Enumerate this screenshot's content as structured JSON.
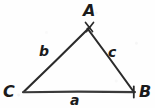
{
  "figure": {
    "kind": "geometry-diagram",
    "background_color": "#fefefe",
    "stroke_color": "#2b2b2b",
    "label_color": "#1b1b1b"
  },
  "vertices": [
    {
      "id": "A",
      "label": "A",
      "x": 89,
      "y": 27,
      "name": "vertex-a-apex"
    },
    {
      "id": "B",
      "label": "B",
      "x": 134,
      "y": 92,
      "name": "vertex-b-bottom-right"
    },
    {
      "id": "C",
      "label": "C",
      "x": 23,
      "y": 92,
      "name": "vertex-c-bottom-left"
    }
  ],
  "sides": [
    {
      "id": "a",
      "label": "a",
      "from": "C",
      "to": "B",
      "name": "side-a-bottom"
    },
    {
      "id": "b",
      "label": "b",
      "from": "C",
      "to": "A",
      "name": "side-b-left"
    },
    {
      "id": "c",
      "label": "c",
      "from": "A",
      "to": "B",
      "name": "side-c-right"
    }
  ],
  "marks": [
    {
      "name": "tick-at-vertex-a",
      "at": "A"
    },
    {
      "name": "tick-at-vertex-b",
      "at": "B"
    }
  ]
}
